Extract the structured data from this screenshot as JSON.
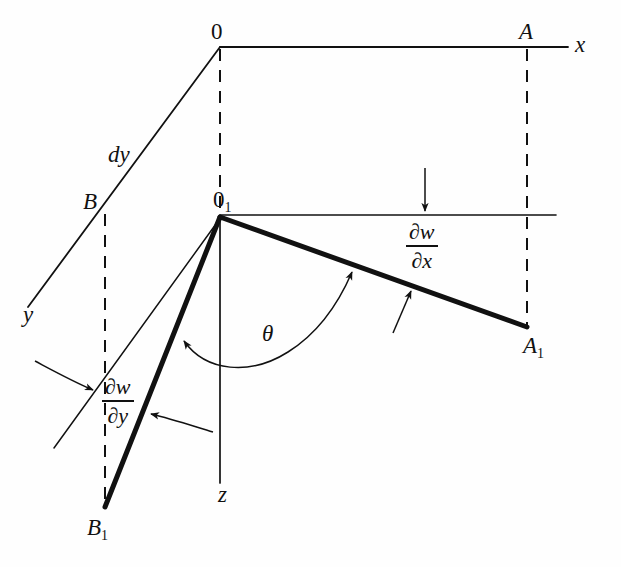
{
  "figure": {
    "kind": "geometry-diagram",
    "background_color": "#fefefe",
    "ink_color": "#111111"
  },
  "labels": {
    "origin": "0",
    "origin_deflected_base": "0",
    "origin_deflected_sub": "1",
    "axis_x": "x",
    "axis_y": "y",
    "axis_z": "z",
    "point_a": "A",
    "point_a1_base": "A",
    "point_a1_sub": "1",
    "point_b": "B",
    "point_b1_base": "B",
    "point_b1_sub": "1",
    "dy": "dy",
    "theta": "θ"
  },
  "fractions": {
    "dw_dx": {
      "numerator": "∂w",
      "denominator": "∂x"
    },
    "dw_dy": {
      "numerator": "∂w",
      "denominator": "∂y"
    }
  },
  "geometry": {
    "origin": {
      "x": 220,
      "y": 47
    },
    "origin1": {
      "x": 220,
      "y": 218
    },
    "point_a": {
      "x": 527,
      "y": 47
    },
    "point_a1": {
      "x": 527,
      "y": 327
    },
    "point_b": {
      "x": 105,
      "y": 214
    },
    "point_b1": {
      "x": 105,
      "y": 507
    },
    "axis_x_end": {
      "x": 568,
      "y": 47
    },
    "axis_y_end": {
      "x": 28,
      "y": 307
    },
    "axis_z_end": {
      "x": 220,
      "y": 483
    },
    "o1_horizontal_end": {
      "x": 556,
      "y": 215
    },
    "o1_thin_lower_left_end": {
      "x": 54,
      "y": 448
    }
  }
}
